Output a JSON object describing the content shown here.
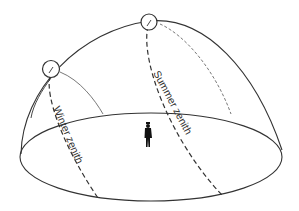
{
  "diagram": {
    "type": "celestial-dome",
    "labels": {
      "winter": "Winter zenith",
      "summer": "Summer zenith"
    },
    "elements": {
      "dome": "hemisphere-outline",
      "horizon": "horizon-ellipse",
      "observer": "standing-person",
      "sun_winter": "sun-circle-low",
      "sun_summer": "sun-circle-high"
    },
    "colors": {
      "stroke": "#333333",
      "background": "#ffffff"
    }
  }
}
